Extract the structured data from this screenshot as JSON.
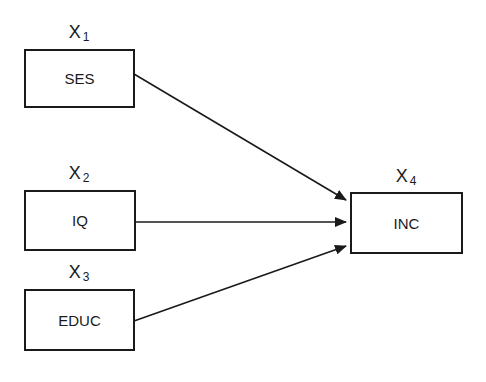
{
  "diagram": {
    "nodes": [
      {
        "id": "ses",
        "label": "SES",
        "var": "X",
        "sub": "1"
      },
      {
        "id": "iq",
        "label": "IQ",
        "var": "X",
        "sub": "2"
      },
      {
        "id": "educ",
        "label": "EDUC",
        "var": "X",
        "sub": "3"
      },
      {
        "id": "inc",
        "label": "INC",
        "var": "X",
        "sub": "4"
      }
    ],
    "edges": [
      {
        "from": "SES",
        "to": "INC"
      },
      {
        "from": "IQ",
        "to": "INC"
      },
      {
        "from": "EDUC",
        "to": "INC"
      }
    ]
  }
}
